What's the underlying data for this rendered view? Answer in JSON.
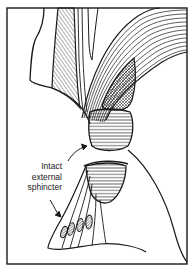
{
  "figure": {
    "type": "anatomical-line-drawing",
    "colors": {
      "ink": "#1a1a1a",
      "background": "#ffffff"
    },
    "label": {
      "lines": [
        "Intact",
        "external",
        "sphincter"
      ]
    },
    "arrows": [
      {
        "name": "arrow-to-upper-sphincter-band",
        "from": [
          68,
          160
        ],
        "to": [
          88,
          145
        ]
      },
      {
        "name": "arrow-to-sphincter-fibres",
        "from": [
          50,
          200
        ],
        "to": [
          60,
          216
        ]
      }
    ],
    "regions": [
      "left-wall-outline",
      "left-hatched-muscle",
      "levator-fibre-fan",
      "crosshatched-puborectalis",
      "upper-hatched-sphincter-band",
      "lower-hatched-sphincter-mass",
      "external-sphincter-fibre-fan",
      "sphincter-fibre-cross-sections"
    ]
  }
}
